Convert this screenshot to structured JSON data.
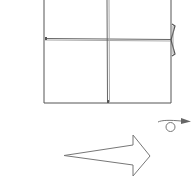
{
  "diagram": {
    "type": "origami-fold-step",
    "colors": {
      "line": "#555555",
      "crease": "#999999",
      "paper": "#ffffff",
      "arrow_fill": "#555555"
    },
    "elements": [
      {
        "name": "paper-square-grid",
        "description": "square paper divided into four quadrants by crease lines"
      },
      {
        "name": "side-flap",
        "description": "small folded flap on right edge at horizontal crease"
      },
      {
        "name": "turn-over-symbol",
        "description": "loop arrow indicating turn the model over"
      },
      {
        "name": "next-step-arrow",
        "description": "large hollow arrow pointing right"
      }
    ]
  }
}
